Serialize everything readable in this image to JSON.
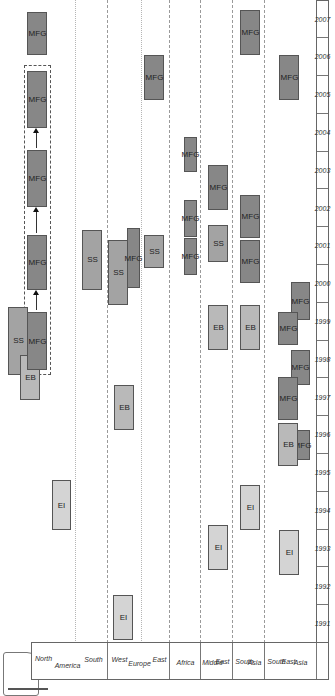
{
  "legend": {
    "items": [
      {
        "code": "EI",
        "shade": "#d4d4d4"
      },
      {
        "code": "EB",
        "shade": "#b9b9b9"
      },
      {
        "code": "SS",
        "shade": "#a3a3a3"
      },
      {
        "code": "MFG",
        "shade": "#878787"
      }
    ]
  },
  "regions": {
    "north_america": {
      "lines": [
        "North",
        "America",
        "South"
      ]
    },
    "europe": {
      "lines": [
        "West",
        "Europe",
        "East"
      ]
    },
    "africa": {
      "lines": [
        "Africa"
      ]
    },
    "middle_east": {
      "lines": [
        "Middle",
        "East"
      ]
    },
    "south_asia": {
      "lines": [
        "South",
        "Asia"
      ]
    },
    "south_east_asia": {
      "lines": [
        "South",
        "East",
        "Asia"
      ]
    }
  },
  "years": [
    "1991",
    "1992",
    "1993",
    "1994",
    "1995",
    "1996",
    "1997",
    "1998",
    "1999",
    "2000",
    "2001",
    "2002",
    "2003",
    "2004",
    "2005",
    "2006",
    "2007"
  ],
  "chart_data": {
    "type": "timeline",
    "title": "",
    "xlabel": "Year",
    "ylabel": "Region",
    "legend": [
      "EI",
      "EB",
      "SS",
      "MFG"
    ],
    "rows": [
      "North America",
      "South America",
      "West Europe",
      "East Europe",
      "Africa",
      "Middle East",
      "South Asia",
      "South East Asia"
    ],
    "entries": [
      {
        "region": "North America",
        "type": "EI",
        "year": 1994
      },
      {
        "region": "North America",
        "type": "EB",
        "year": 1998
      },
      {
        "region": "North America",
        "type": "SS",
        "year": 1999
      },
      {
        "region": "North America",
        "type": "MFG",
        "year": 1999
      },
      {
        "region": "North America",
        "type": "MFG",
        "year": 2001
      },
      {
        "region": "North America",
        "type": "MFG",
        "year": 2003
      },
      {
        "region": "North America",
        "type": "MFG",
        "year": 2005
      },
      {
        "region": "North America",
        "type": "MFG",
        "year": 2007
      },
      {
        "region": "South America",
        "type": "SS",
        "year": 2001
      },
      {
        "region": "West Europe",
        "type": "EI",
        "year": 1991
      },
      {
        "region": "West Europe",
        "type": "EB",
        "year": 1997
      },
      {
        "region": "West Europe",
        "type": "SS",
        "year": 2000
      },
      {
        "region": "West Europe",
        "type": "MFG",
        "year": 2001
      },
      {
        "region": "East Europe",
        "type": "SS",
        "year": 2001
      },
      {
        "region": "East Europe",
        "type": "MFG",
        "year": 2006
      },
      {
        "region": "Africa",
        "type": "MFG",
        "year": 2001
      },
      {
        "region": "Africa",
        "type": "MFG",
        "year": 2002
      },
      {
        "region": "Africa",
        "type": "MFG",
        "year": 2004
      },
      {
        "region": "Middle East",
        "type": "EI",
        "year": 1992
      },
      {
        "region": "Middle East",
        "type": "EB",
        "year": 1999
      },
      {
        "region": "Middle East",
        "type": "SS",
        "year": 2002
      },
      {
        "region": "Middle East",
        "type": "MFG",
        "year": 2003
      },
      {
        "region": "South Asia",
        "type": "EI",
        "year": 1994
      },
      {
        "region": "South Asia",
        "type": "EB",
        "year": 1999
      },
      {
        "region": "South Asia",
        "type": "MFG",
        "year": 2001
      },
      {
        "region": "South Asia",
        "type": "MFG",
        "year": 2002
      },
      {
        "region": "South Asia",
        "type": "MFG",
        "year": 2007
      },
      {
        "region": "South East Asia",
        "type": "EI",
        "year": 1993
      },
      {
        "region": "South East Asia",
        "type": "EB",
        "year": 1996
      },
      {
        "region": "South East Asia",
        "type": "MFG",
        "year": 1996
      },
      {
        "region": "South East Asia",
        "type": "MFG",
        "year": 1997
      },
      {
        "region": "South East Asia",
        "type": "MFG",
        "year": 1998
      },
      {
        "region": "South East Asia",
        "type": "MFG",
        "year": 1999
      },
      {
        "region": "South East Asia",
        "type": "MFG",
        "year": 2000
      },
      {
        "region": "South East Asia",
        "type": "MFG",
        "year": 2006
      }
    ],
    "annotations": [
      "Dashed box groups North America MFG 1999–2005 with arrows showing MFG progression 1999→2001→2003→2005"
    ],
    "orientation": "rotated 90° counter-clockwise"
  },
  "boxes": [
    {
      "t": "MFG",
      "x": 638,
      "y": 27,
      "w": 43,
      "h": 20
    },
    {
      "t": "MFG",
      "x": 565,
      "y": 27,
      "w": 57,
      "h": 20
    },
    {
      "t": "MFG",
      "x": 486,
      "y": 27,
      "w": 57,
      "h": 20
    },
    {
      "t": "MFG",
      "x": 403,
      "y": 27,
      "w": 55,
      "h": 20
    },
    {
      "t": "SS",
      "x": 318,
      "y": 8,
      "w": 68,
      "h": 20
    },
    {
      "t": "EB",
      "x": 293,
      "y": 20,
      "w": 45,
      "h": 20
    },
    {
      "t": "MFG",
      "x": 323,
      "y": 27,
      "w": 58,
      "h": 20
    },
    {
      "t": "EI",
      "x": 163,
      "y": 52,
      "w": 50,
      "h": 19
    },
    {
      "t": "SS",
      "x": 403,
      "y": 82,
      "w": 60,
      "h": 20
    },
    {
      "t": "SS",
      "x": 388,
      "y": 108,
      "w": 65,
      "h": 20
    },
    {
      "t": "MFG",
      "x": 405,
      "y": 127,
      "w": 60,
      "h": 13
    },
    {
      "t": "EB",
      "x": 263,
      "y": 114,
      "w": 45,
      "h": 20
    },
    {
      "t": "EI",
      "x": 53,
      "y": 113,
      "w": 45,
      "h": 20
    },
    {
      "t": "SS",
      "x": 425,
      "y": 144,
      "w": 33,
      "h": 20
    },
    {
      "t": "MFG",
      "x": 593,
      "y": 144,
      "w": 45,
      "h": 20
    },
    {
      "t": "MFG",
      "x": 521,
      "y": 184,
      "w": 35,
      "h": 13
    },
    {
      "t": "MFG",
      "x": 456,
      "y": 184,
      "w": 37,
      "h": 13
    },
    {
      "t": "MFG",
      "x": 418,
      "y": 184,
      "w": 37,
      "h": 13
    },
    {
      "t": "MFG",
      "x": 483,
      "y": 208,
      "w": 45,
      "h": 20
    },
    {
      "t": "SS",
      "x": 431,
      "y": 208,
      "w": 37,
      "h": 20
    },
    {
      "t": "EB",
      "x": 343,
      "y": 208,
      "w": 45,
      "h": 20
    },
    {
      "t": "EI",
      "x": 123,
      "y": 208,
      "w": 45,
      "h": 20
    },
    {
      "t": "MFG",
      "x": 638,
      "y": 240,
      "w": 45,
      "h": 20
    },
    {
      "t": "MFG",
      "x": 455,
      "y": 240,
      "w": 43,
      "h": 20
    },
    {
      "t": "MFG",
      "x": 410,
      "y": 240,
      "w": 43,
      "h": 20
    },
    {
      "t": "EB",
      "x": 343,
      "y": 240,
      "w": 45,
      "h": 20
    },
    {
      "t": "EI",
      "x": 163,
      "y": 240,
      "w": 45,
      "h": 20
    },
    {
      "t": "MFG",
      "x": 593,
      "y": 279,
      "w": 45,
      "h": 20
    },
    {
      "t": "MFG",
      "x": 373,
      "y": 291,
      "w": 38,
      "h": 19
    },
    {
      "t": "MFG",
      "x": 348,
      "y": 278,
      "w": 33,
      "h": 20
    },
    {
      "t": "MFG",
      "x": 308,
      "y": 291,
      "w": 35,
      "h": 19
    },
    {
      "t": "MFG",
      "x": 273,
      "y": 278,
      "w": 43,
      "h": 20
    },
    {
      "t": "MFG",
      "x": 233,
      "y": 295,
      "w": 30,
      "h": 15
    },
    {
      "t": "EB",
      "x": 227,
      "y": 278,
      "w": 43,
      "h": 20
    },
    {
      "t": "EI",
      "x": 118,
      "y": 279,
      "w": 45,
      "h": 20
    }
  ]
}
